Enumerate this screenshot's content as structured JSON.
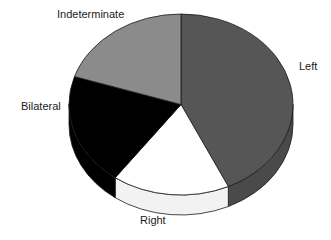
{
  "chart_data": {
    "type": "pie",
    "title": "",
    "subtitle": "",
    "xlabel": "",
    "ylabel": "",
    "legend_position": "none",
    "grid": false,
    "three_d": true,
    "start_angle_deg": 0,
    "direction": "clockwise",
    "categories": [
      "Left",
      "Right",
      "Bilateral",
      "Indeterminate"
    ],
    "values": [
      43,
      17,
      20,
      20
    ],
    "units": "percent",
    "slices": [
      {
        "label": "Left",
        "value": 43,
        "color": "#565656",
        "side_color": "#4a4a4a",
        "start_deg": 0,
        "end_deg": 155
      },
      {
        "label": "Right",
        "value": 17,
        "color": "#ffffff",
        "side_color": "#f2f2f2",
        "start_deg": 155,
        "end_deg": 216
      },
      {
        "label": "Bilateral",
        "value": 20,
        "color": "#000000",
        "side_color": "#000000",
        "start_deg": 216,
        "end_deg": 288
      },
      {
        "label": "Indeterminate",
        "value": 20,
        "color": "#8b8b8b",
        "side_color": "#7d7d7d",
        "start_deg": 288,
        "end_deg": 360
      }
    ],
    "annotations": []
  },
  "labels": {
    "indeterminate": "Indeterminate",
    "left": "Left",
    "bilateral": "Bilateral",
    "right": "Right"
  },
  "colors": {
    "background": "#ffffff",
    "outline": "#1a1a1a",
    "text": "#1b1b1b",
    "left_slice": "#565656",
    "right_slice": "#ffffff",
    "bilateral_slice": "#000000",
    "indeterminate_slice": "#8b8b8b"
  }
}
